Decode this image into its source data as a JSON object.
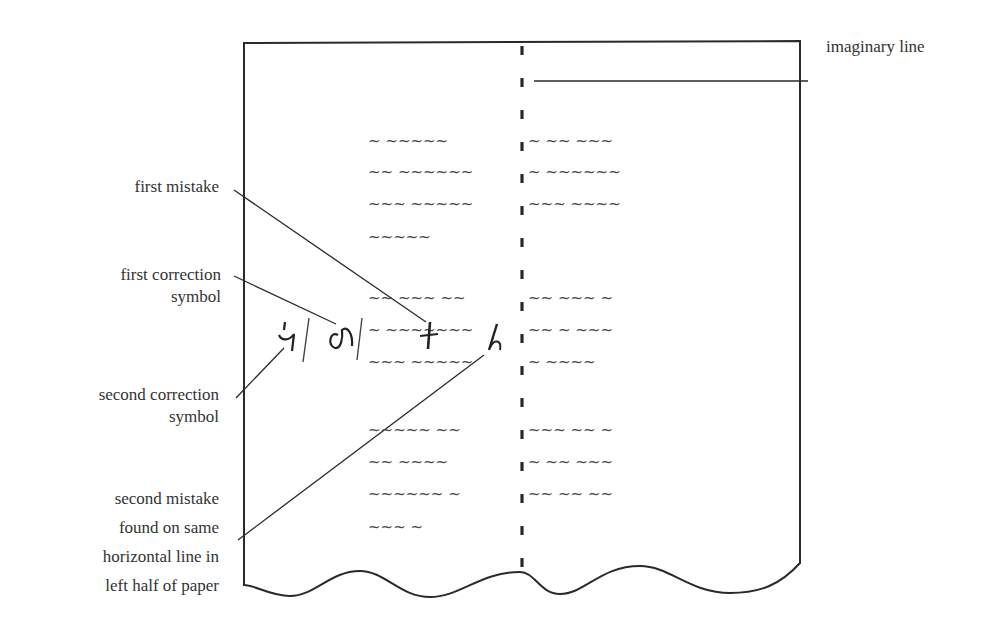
{
  "diagram": {
    "labels": {
      "imaginary_line": "imaginary line",
      "first_mistake": "first mistake",
      "first_correction": [
        "first correction",
        "symbol"
      ],
      "second_correction": [
        "second correction",
        "symbol"
      ],
      "second_mistake": [
        "second mistake",
        "found on same",
        "horizontal line in",
        "left half of paper"
      ]
    },
    "correction_symbols": {
      "first": "ᕴ",
      "second": "ᔦ"
    },
    "mistake_marks": {
      "first": "t",
      "second": "h"
    },
    "text_rows": [
      {
        "y": 142,
        "left": "~  ~~~~~  ",
        "right": "~  ~~  ~~~"
      },
      {
        "y": 173,
        "left": "~~  ~~~~~~",
        "right": "~  ~~~~~~"
      },
      {
        "y": 205,
        "left": "~~~  ~~~~~",
        "right": "~~~  ~~~~"
      },
      {
        "y": 238,
        "left": "~~~~~",
        "right": ""
      },
      {
        "y": 299,
        "left": "~~  ~~~  ~~",
        "right": "~~  ~~~  ~"
      },
      {
        "y": 331,
        "left": "~  ~~~~~~~",
        "right": "~~  ~  ~~~"
      },
      {
        "y": 363,
        "left": "~~~  ~~~~~",
        "right": "~  ~~~~"
      },
      {
        "y": 431,
        "left": "~~~~~  ~~",
        "right": "~~~  ~~  ~"
      },
      {
        "y": 463,
        "left": "~~  ~~~~  ",
        "right": "~  ~~  ~~~"
      },
      {
        "y": 495,
        "left": "~~~~~~  ~",
        "right": "~~  ~~  ~~"
      },
      {
        "y": 528,
        "left": "~~~  ~",
        "right": ""
      }
    ],
    "colors": {
      "ink": "#2a2a2a",
      "paper": "#ffffff"
    }
  }
}
